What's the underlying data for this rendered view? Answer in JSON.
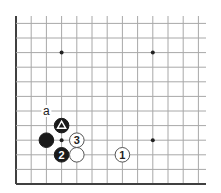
{
  "diagram": {
    "type": "go-board-corner",
    "colors": {
      "background": "#ffffff",
      "grid": "#a8a8a8",
      "edge": "#404040",
      "black_stone": "#1a1a1a",
      "white_stone": "#ffffff",
      "stone_outline": "#555555",
      "hoshi": "#222222"
    },
    "grid": {
      "origin_x": 16,
      "origin_y": 184,
      "spacing_x": 15.2,
      "spacing_y": 14.6,
      "columns": 13,
      "rows": 12,
      "right_extent": 206,
      "top_extent": 16
    },
    "hoshi": [
      {
        "col": 3,
        "row": 9
      },
      {
        "col": 9,
        "row": 9
      },
      {
        "col": 3,
        "row": 3
      },
      {
        "col": 9,
        "row": 3
      }
    ],
    "stones": [
      {
        "color": "black",
        "col": 2,
        "row": 3,
        "label": ""
      },
      {
        "color": "black",
        "col": 3,
        "row": 4,
        "label": "",
        "marker": "triangle"
      },
      {
        "color": "black",
        "col": 3,
        "row": 2,
        "label": "2"
      },
      {
        "color": "white",
        "col": 4,
        "row": 2,
        "label": ""
      },
      {
        "color": "white",
        "col": 4,
        "row": 3,
        "label": "3"
      },
      {
        "color": "white",
        "col": 7,
        "row": 2,
        "label": "1"
      }
    ],
    "annotations": [
      {
        "text": "a",
        "col": 2,
        "row": 5
      }
    ]
  }
}
